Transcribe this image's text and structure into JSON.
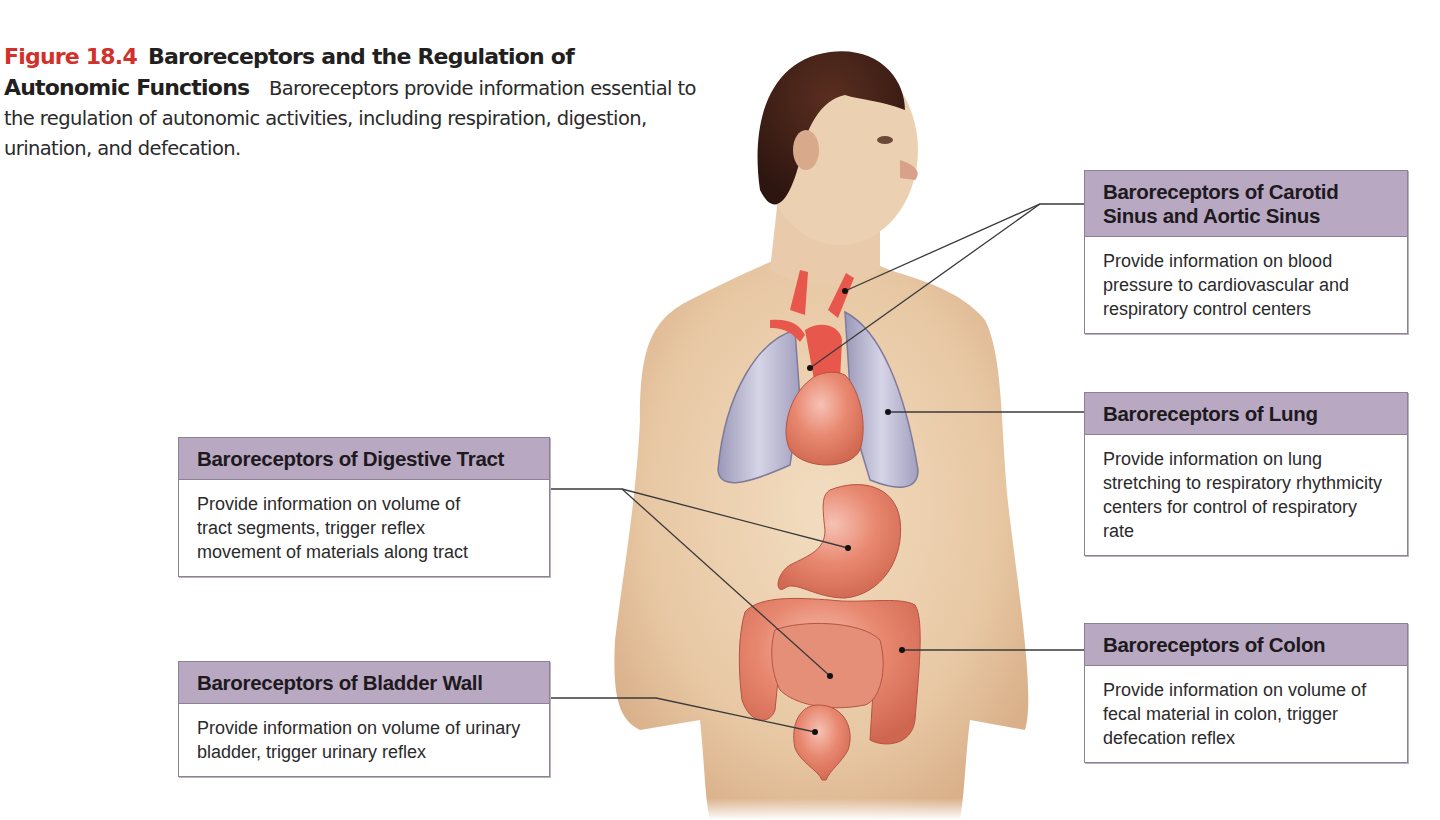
{
  "figure": {
    "number": "Figure 18.4",
    "title": "Baroreceptors and the Regulation of Autonomic Functions",
    "caption_text": "Baroreceptors provide information essential to the regulation of autonomic activities, including respiration, digestion, urination, and defecation.",
    "accent_color": "#d2302a",
    "header_color": "#b9a8c2"
  },
  "callouts": [
    {
      "id": "carotid",
      "title": "Baroreceptors of Carotid Sinus and Aortic Sinus",
      "description": "Provide information on blood pressure to cardiovascular and respiratory control centers",
      "target": [
        "carotid artery",
        "aortic arch"
      ]
    },
    {
      "id": "lung",
      "title": "Baroreceptors of Lung",
      "description": "Provide information on lung stretching to respiratory rhythmicity centers for control of respiratory rate",
      "target": [
        "left lung"
      ]
    },
    {
      "id": "colon",
      "title": "Baroreceptors of Colon",
      "description": "Provide information on volume of fecal material in colon, trigger defecation reflex",
      "target": [
        "descending colon"
      ]
    },
    {
      "id": "digestive",
      "title": "Baroreceptors of Digestive Tract",
      "description": "Provide information on volume of tract segments, trigger reflex movement of materials along tract",
      "target": [
        "stomach",
        "small intestine"
      ]
    },
    {
      "id": "bladder",
      "title": "Baroreceptors of Bladder Wall",
      "description": "Provide information on volume of urinary bladder, trigger urinary reflex",
      "target": [
        "urinary bladder"
      ]
    }
  ],
  "illustration": {
    "subject": "male torso with head turned right",
    "organs": [
      "carotid arteries",
      "aortic arch",
      "lungs",
      "heart",
      "stomach",
      "large intestine",
      "small intestine",
      "urinary bladder"
    ]
  }
}
